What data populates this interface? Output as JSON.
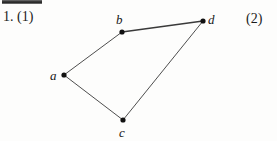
{
  "page": {
    "background_color": "#fdfdfc",
    "ink_color": "#1b1b1b",
    "scan_artifact": {
      "name": "scan-edge-bar",
      "color": "#2a2a2a"
    }
  },
  "captions": {
    "item_number": "1. (1)",
    "part_label": "(2)"
  },
  "figure": {
    "type": "graph-diagram",
    "vertices": [
      {
        "id": "a",
        "label": "a",
        "x": 64,
        "y": 75,
        "label_x": 50,
        "label_y": 69
      },
      {
        "id": "b",
        "label": "b",
        "x": 122,
        "y": 32,
        "label_x": 116,
        "label_y": 13
      },
      {
        "id": "c",
        "label": "c",
        "x": 123,
        "y": 120,
        "label_x": 119,
        "label_y": 126
      },
      {
        "id": "d",
        "label": "d",
        "x": 203,
        "y": 21,
        "label_x": 208,
        "label_y": 13
      }
    ],
    "edges": [
      {
        "from": "a",
        "to": "b",
        "width": 0.9
      },
      {
        "from": "b",
        "to": "d",
        "width": 1.5
      },
      {
        "from": "d",
        "to": "c",
        "width": 0.9
      },
      {
        "from": "c",
        "to": "a",
        "width": 0.9
      }
    ],
    "vertex_radius": 2.6,
    "vertex_color": "#111111",
    "edge_color": "#3a3a3a"
  }
}
